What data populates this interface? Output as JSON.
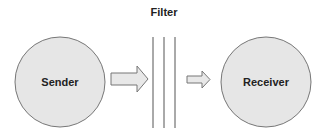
{
  "title": "Filter",
  "nodes": [
    {
      "id": "sender",
      "label": "Sender"
    },
    {
      "id": "receiver",
      "label": "Receiver"
    }
  ],
  "filter": {
    "label": "Filter",
    "line_count": 3
  },
  "edges": [
    {
      "from": "sender",
      "to": "filter"
    },
    {
      "from": "filter",
      "to": "receiver"
    }
  ],
  "colors": {
    "node_fill": "#e6e6e6",
    "node_stroke": "#777777",
    "arrow_fill": "#e8e8e8",
    "line": "#555555"
  }
}
